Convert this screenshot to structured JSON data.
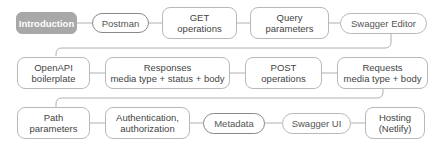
{
  "diagram": {
    "type": "flow",
    "nodes": [
      {
        "id": "n1",
        "label": "Introduction",
        "active": true
      },
      {
        "id": "n2",
        "label": "Postman"
      },
      {
        "id": "n3",
        "label": "GET\noperations"
      },
      {
        "id": "n4",
        "label": "Query\nparameters"
      },
      {
        "id": "n5",
        "label": "Swagger Editor"
      },
      {
        "id": "n6",
        "label": "OpenAPI\nboilerplate"
      },
      {
        "id": "n7",
        "label": "Responses\nmedia type + status + body"
      },
      {
        "id": "n8",
        "label": "POST\noperations"
      },
      {
        "id": "n9",
        "label": "Requests\nmedia type + body"
      },
      {
        "id": "n10",
        "label": "Path\nparameters"
      },
      {
        "id": "n11",
        "label": "Authentication,\nauthorization"
      },
      {
        "id": "n12",
        "label": "Metadata"
      },
      {
        "id": "n13",
        "label": "Swagger UI"
      },
      {
        "id": "n14",
        "label": "Hosting\n(Netlify)"
      }
    ],
    "colors": {
      "active_fill": "#a8a8a8",
      "border": "#b8b8b8",
      "line": "#b0b0b0",
      "text": "#444444"
    }
  }
}
